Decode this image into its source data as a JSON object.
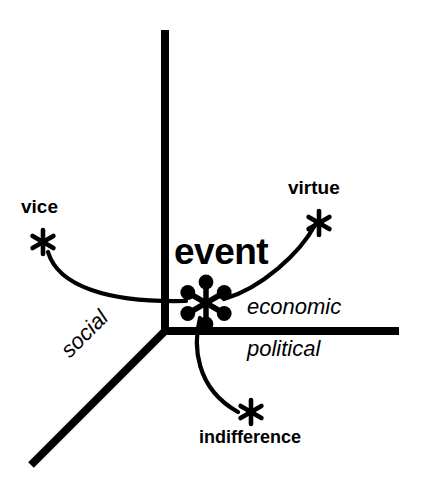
{
  "figure": {
    "kind": "three-axis-conceptual-diagram",
    "background_color": "#ffffff",
    "ink_color": "#000000"
  },
  "center_node": {
    "label": "event",
    "marker_name": "six-spoke-node-icon",
    "spoke_count": 6
  },
  "axes": [
    {
      "id": "vertical",
      "label": "",
      "style": "plain"
    },
    {
      "id": "horizontal",
      "label": "economic",
      "style": "italic"
    },
    {
      "id": "horizontal-lower",
      "label": "political",
      "style": "italic"
    },
    {
      "id": "diagonal",
      "label": "social",
      "style": "italic"
    }
  ],
  "axis_labels": {
    "economic": "economic",
    "political": "political",
    "social": "social"
  },
  "outcomes": [
    {
      "id": "vice",
      "label": "vice",
      "marker_name": "asterisk-icon"
    },
    {
      "id": "virtue",
      "label": "virtue",
      "marker_name": "asterisk-icon"
    },
    {
      "id": "indifference",
      "label": "indifference",
      "marker_name": "asterisk-icon"
    }
  ],
  "labels": {
    "event": "event",
    "vice": "vice",
    "virtue": "virtue",
    "indifference": "indifference"
  }
}
